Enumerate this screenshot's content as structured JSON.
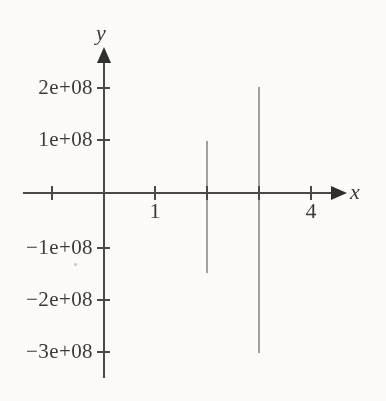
{
  "figure": {
    "background": "#fcfbf8",
    "axis_color": "#4a4a4a",
    "arrow_color": "#2f2f2f",
    "curve_color": "#a0a0a0",
    "text_color": "#3b3b3b"
  },
  "chart_data": {
    "type": "line",
    "subtype": "vertical-spike-segments",
    "title": "",
    "xlabel": "x",
    "ylabel": "y",
    "xlim": [
      -1.56,
      4.67
    ],
    "ylim": [
      -353000000,
      277000000
    ],
    "grid": false,
    "legend": null,
    "x_ticks": [
      -1,
      0,
      1,
      2,
      3,
      4
    ],
    "x_tick_labels": [
      "",
      "",
      "1",
      "",
      "",
      "4"
    ],
    "y_ticks": [
      200000000,
      100000000,
      -100000000,
      -200000000,
      -300000000
    ],
    "y_tick_labels": [
      "2e+08",
      "1e+08",
      "−1e+08",
      "−2e+08",
      "−3e+08"
    ],
    "series": [
      {
        "name": "spike-at-x-2",
        "type": "vertical-segment",
        "x": 2,
        "y_top": 100000000,
        "y_bottom": -150000000
      },
      {
        "name": "spike-at-x-3",
        "type": "vertical-segment",
        "x": 3,
        "y_top": 200000000,
        "y_bottom": -300000000
      }
    ]
  }
}
